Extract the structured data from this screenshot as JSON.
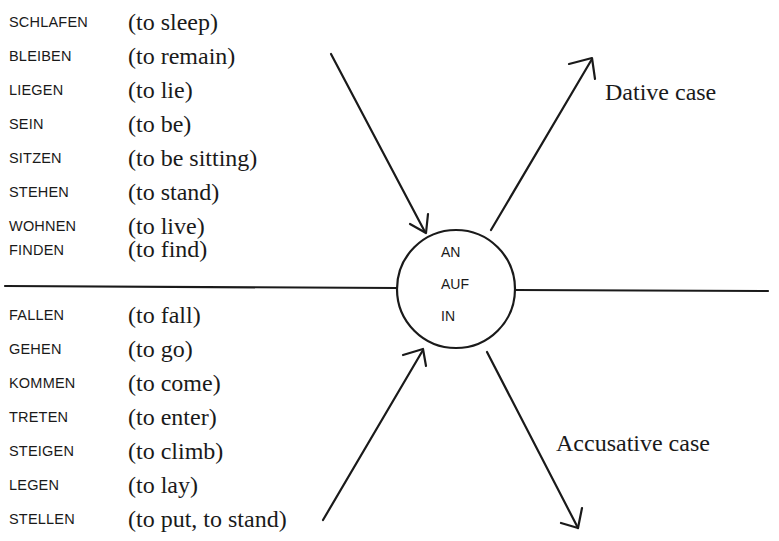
{
  "diagram": {
    "dative_verbs": [
      {
        "german": "SCHLAFEN",
        "english": "(to sleep)"
      },
      {
        "german": "BLEIBEN",
        "english": "(to remain)"
      },
      {
        "german": "LIEGEN",
        "english": "(to lie)"
      },
      {
        "german": "SEIN",
        "english": "(to be)"
      },
      {
        "german": "SITZEN",
        "english": "(to be sitting)"
      },
      {
        "german": "STEHEN",
        "english": "(to stand)"
      },
      {
        "german": "WOHNEN",
        "english": "(to live)"
      },
      {
        "german": "FINDEN",
        "english": "(to find)"
      }
    ],
    "accusative_verbs": [
      {
        "german": "FALLEN",
        "english": "(to fall)"
      },
      {
        "german": "GEHEN",
        "english": "(to go)"
      },
      {
        "german": "KOMMEN",
        "english": "(to come)"
      },
      {
        "german": "TRETEN",
        "english": "(to enter)"
      },
      {
        "german": "STEIGEN",
        "english": "(to climb)"
      },
      {
        "german": "LEGEN",
        "english": "(to lay)"
      },
      {
        "german": "STELLEN",
        "english": "(to put, to stand)"
      }
    ],
    "prepositions": [
      "AN",
      "AUF",
      "IN"
    ],
    "dative_label": "Dative case",
    "accusative_label": "Accusative case",
    "line_color": "#1a1a1a"
  }
}
